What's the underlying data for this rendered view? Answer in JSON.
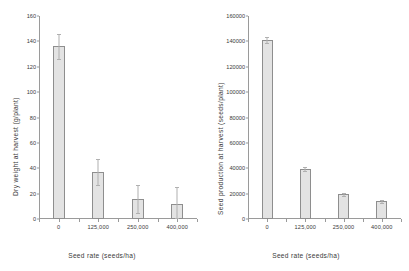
{
  "chart_data": [
    {
      "type": "bar",
      "panel": "left",
      "title": "",
      "xlabel": "Seed rate (seeds/ha)",
      "ylabel": "Dry weight at harvest (g/plant)",
      "categories": [
        "0",
        "125,000",
        "250,000",
        "400,000"
      ],
      "values": [
        136,
        37,
        16,
        12
      ],
      "errors_upper": [
        146,
        47,
        27,
        25
      ],
      "errors_lower": [
        126,
        27,
        5,
        1
      ],
      "yticks": [
        "0",
        "20",
        "40",
        "60",
        "80",
        "100",
        "120",
        "140",
        "160"
      ],
      "ytick_values": [
        0,
        20,
        40,
        60,
        80,
        100,
        120,
        140,
        160
      ],
      "ylim": [
        0,
        160
      ],
      "grid": false,
      "legend": "none"
    },
    {
      "type": "bar",
      "panel": "right",
      "title": "",
      "xlabel": "Seed rate (seeds/ha)",
      "ylabel": "Seed production at harvest (seeds/plant)",
      "categories": [
        "0",
        "125,000",
        "250,000",
        "400,000"
      ],
      "values": [
        141000,
        39500,
        19500,
        14000
      ],
      "errors_upper": [
        143500,
        41000,
        20800,
        15200
      ],
      "errors_lower": [
        138500,
        38000,
        18200,
        12800
      ],
      "yticks": [
        "0",
        "20000",
        "40000",
        "60000",
        "80000",
        "100000",
        "120000",
        "140000",
        "160000"
      ],
      "ytick_values": [
        0,
        20000,
        40000,
        60000,
        80000,
        100000,
        120000,
        140000,
        160000
      ],
      "ylim": [
        0,
        160000
      ],
      "grid": false,
      "legend": "none"
    }
  ],
  "style": {
    "bar_fill": "#e3e3e3",
    "bar_border": "#8e8e8e",
    "axis_color": "#9a9a9a",
    "error_color": "#b0b0b0",
    "text_color": "#3a3a3a",
    "background": "#ffffff"
  }
}
